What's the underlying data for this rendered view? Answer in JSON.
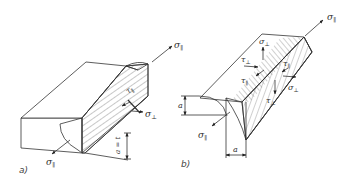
{
  "diagram": {
    "colors": {
      "line": "#333333",
      "background": "#ffffff"
    },
    "panels": [
      {
        "id": "a",
        "caption": "a)",
        "description": "Butt weld cross-section on rectangular bar",
        "labels": {
          "sigma_par_top": {
            "symbol": "σ",
            "subscript": "∥"
          },
          "sigma_par_bottom": {
            "symbol": "σ",
            "subscript": "∥"
          },
          "tau_par": {
            "symbol": "τ",
            "subscript": "∥"
          },
          "sigma_perp": {
            "symbol": "σ",
            "subscript": "⊥"
          },
          "dimension": "a = t"
        }
      },
      {
        "id": "b",
        "caption": "b)",
        "description": "Fillet weld with hatched throat section",
        "labels": {
          "sigma_par_top": {
            "symbol": "σ",
            "subscript": "∥"
          },
          "sigma_par_bottom": {
            "symbol": "σ",
            "subscript": "∥"
          },
          "sigma_perp_top": {
            "symbol": "σ",
            "subscript": "⊥"
          },
          "sigma_perp_right": {
            "symbol": "σ",
            "subscript": "⊥"
          },
          "tau_perp_left": {
            "symbol": "τ",
            "subscript": "⊥"
          },
          "tau_perp_bottom": {
            "symbol": "τ",
            "subscript": "⊥"
          },
          "tau_par_left": {
            "symbol": "τ",
            "subscript": "∥"
          },
          "tau_par_right": {
            "symbol": "τ",
            "subscript": "∥"
          },
          "dimension_vertical": "a",
          "dimension_horizontal": "a"
        }
      }
    ]
  }
}
